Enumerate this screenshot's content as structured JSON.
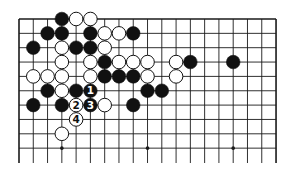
{
  "diagram": {
    "type": "go-board-fragment",
    "board_size": 19,
    "visible_columns": 19,
    "visible_rows": 10,
    "edges": [
      "top",
      "left",
      "right"
    ],
    "grid": {
      "left": 19,
      "top": 19,
      "col_spacing": 14.28,
      "row_spacing": 14.35,
      "line_extend_bottom": 163
    },
    "colors": {
      "line": "#1a1a1a",
      "black_stone": "#111111",
      "white_stone": "#ffffff",
      "stone_outline": "#111111"
    },
    "star_points": [
      {
        "col": 3,
        "row": 9
      },
      {
        "col": 9,
        "row": 9
      },
      {
        "col": 15,
        "row": 9
      }
    ],
    "stones": [
      {
        "color": "black",
        "col": 3,
        "row": 0
      },
      {
        "color": "white",
        "col": 4,
        "row": 0
      },
      {
        "color": "white",
        "col": 5,
        "row": 0
      },
      {
        "color": "black",
        "col": 2,
        "row": 1
      },
      {
        "color": "black",
        "col": 3,
        "row": 1
      },
      {
        "color": "black",
        "col": 5,
        "row": 1
      },
      {
        "color": "white",
        "col": 6,
        "row": 1
      },
      {
        "color": "white",
        "col": 7,
        "row": 1
      },
      {
        "color": "black",
        "col": 8,
        "row": 1
      },
      {
        "color": "black",
        "col": 1,
        "row": 2
      },
      {
        "color": "white",
        "col": 3,
        "row": 2
      },
      {
        "color": "black",
        "col": 4,
        "row": 2
      },
      {
        "color": "black",
        "col": 5,
        "row": 2
      },
      {
        "color": "white",
        "col": 6,
        "row": 2
      },
      {
        "color": "white",
        "col": 3,
        "row": 3
      },
      {
        "color": "white",
        "col": 5,
        "row": 3
      },
      {
        "color": "black",
        "col": 6,
        "row": 3
      },
      {
        "color": "white",
        "col": 7,
        "row": 3
      },
      {
        "color": "white",
        "col": 8,
        "row": 3
      },
      {
        "color": "white",
        "col": 9,
        "row": 3
      },
      {
        "color": "white",
        "col": 11,
        "row": 3
      },
      {
        "color": "black",
        "col": 12,
        "row": 3
      },
      {
        "color": "black",
        "col": 15,
        "row": 3
      },
      {
        "color": "white",
        "col": 1,
        "row": 4
      },
      {
        "color": "white",
        "col": 2,
        "row": 4
      },
      {
        "color": "white",
        "col": 3,
        "row": 4
      },
      {
        "color": "white",
        "col": 5,
        "row": 4
      },
      {
        "color": "black",
        "col": 6,
        "row": 4
      },
      {
        "color": "black",
        "col": 7,
        "row": 4
      },
      {
        "color": "black",
        "col": 8,
        "row": 4
      },
      {
        "color": "white",
        "col": 9,
        "row": 4
      },
      {
        "color": "white",
        "col": 11,
        "row": 4
      },
      {
        "color": "black",
        "col": 2,
        "row": 5
      },
      {
        "color": "white",
        "col": 3,
        "row": 5
      },
      {
        "color": "black",
        "col": 4,
        "row": 5
      },
      {
        "color": "black",
        "col": 5,
        "row": 5,
        "label": "1"
      },
      {
        "color": "black",
        "col": 9,
        "row": 5
      },
      {
        "color": "black",
        "col": 10,
        "row": 5
      },
      {
        "color": "black",
        "col": 1,
        "row": 6
      },
      {
        "color": "black",
        "col": 3,
        "row": 6
      },
      {
        "color": "white",
        "col": 4,
        "row": 6,
        "label": "2"
      },
      {
        "color": "black",
        "col": 5,
        "row": 6,
        "label": "3"
      },
      {
        "color": "white",
        "col": 6,
        "row": 6
      },
      {
        "color": "black",
        "col": 8,
        "row": 6
      },
      {
        "color": "white",
        "col": 4,
        "row": 7,
        "label": "4"
      },
      {
        "color": "white",
        "col": 3,
        "row": 8
      }
    ],
    "move_labels": [
      "1",
      "2",
      "3",
      "4"
    ]
  }
}
